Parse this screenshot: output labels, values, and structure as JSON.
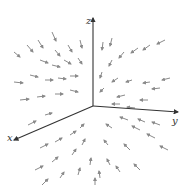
{
  "diagram": {
    "title": "",
    "colors": {
      "axis": "#333333",
      "arrow": "#8a8a8a",
      "background": "#ffffff"
    },
    "origin": [
      93,
      106
    ],
    "axes": [
      {
        "name": "z",
        "label": "z",
        "end": [
          93,
          18
        ],
        "label_pos": [
          86,
          24
        ]
      },
      {
        "name": "y",
        "label": "y",
        "end": [
          178,
          112
        ],
        "label_pos": [
          172,
          124
        ]
      },
      {
        "name": "x",
        "label": "x",
        "end": [
          14,
          140
        ],
        "label_pos": [
          7,
          141
        ]
      }
    ],
    "arrows": [
      [
        14,
        52,
        20,
        57
      ],
      [
        27,
        45,
        33,
        52
      ],
      [
        38,
        40,
        43,
        48
      ],
      [
        52,
        32,
        56,
        41
      ],
      [
        55,
        50,
        60,
        56
      ],
      [
        68,
        45,
        72,
        52
      ],
      [
        80,
        40,
        82,
        48
      ],
      [
        40,
        60,
        48,
        63
      ],
      [
        52,
        65,
        60,
        67
      ],
      [
        64,
        60,
        71,
        64
      ],
      [
        78,
        58,
        82,
        64
      ],
      [
        70,
        76,
        78,
        76
      ],
      [
        58,
        78,
        66,
        79
      ],
      [
        45,
        80,
        53,
        80
      ],
      [
        30,
        75,
        38,
        77
      ],
      [
        14,
        82,
        23,
        83
      ],
      [
        20,
        100,
        29,
        99
      ],
      [
        37,
        97,
        45,
        96
      ],
      [
        55,
        94,
        63,
        94
      ],
      [
        70,
        90,
        78,
        92
      ],
      [
        103,
        42,
        102,
        50
      ],
      [
        112,
        38,
        110,
        46
      ],
      [
        112,
        60,
        109,
        66
      ],
      [
        124,
        52,
        119,
        58
      ],
      [
        138,
        48,
        131,
        53
      ],
      [
        150,
        45,
        143,
        50
      ],
      [
        165,
        40,
        157,
        44
      ],
      [
        170,
        78,
        162,
        80
      ],
      [
        150,
        82,
        143,
        83
      ],
      [
        132,
        80,
        126,
        82
      ],
      [
        118,
        78,
        112,
        82
      ],
      [
        102,
        72,
        100,
        78
      ],
      [
        104,
        88,
        100,
        92
      ],
      [
        125,
        95,
        117,
        97
      ],
      [
        148,
        100,
        140,
        100
      ],
      [
        160,
        88,
        152,
        89
      ],
      [
        120,
        104,
        112,
        104
      ],
      [
        135,
        108,
        127,
        107
      ],
      [
        40,
        148,
        48,
        144
      ],
      [
        55,
        142,
        62,
        138
      ],
      [
        70,
        135,
        76,
        131
      ],
      [
        80,
        128,
        84,
        124
      ],
      [
        35,
        170,
        43,
        166
      ],
      [
        52,
        162,
        58,
        157
      ],
      [
        72,
        155,
        76,
        149
      ],
      [
        82,
        145,
        85,
        139
      ],
      [
        42,
        185,
        48,
        179
      ],
      [
        60,
        178,
        64,
        172
      ],
      [
        78,
        175,
        80,
        168
      ],
      [
        90,
        165,
        91,
        158
      ],
      [
        100,
        178,
        99,
        171
      ],
      [
        110,
        165,
        107,
        159
      ],
      [
        108,
        145,
        104,
        140
      ],
      [
        112,
        128,
        106,
        124
      ],
      [
        128,
        120,
        120,
        117
      ],
      [
        140,
        130,
        132,
        126
      ],
      [
        155,
        138,
        147,
        134
      ],
      [
        168,
        150,
        160,
        146
      ],
      [
        130,
        150,
        124,
        144
      ],
      [
        140,
        170,
        134,
        164
      ],
      [
        120,
        172,
        116,
        166
      ],
      [
        145,
        122,
        138,
        119
      ],
      [
        160,
        125,
        152,
        122
      ],
      [
        45,
        115,
        52,
        113
      ],
      [
        28,
        125,
        36,
        121
      ],
      [
        95,
        185,
        95,
        178
      ]
    ]
  }
}
